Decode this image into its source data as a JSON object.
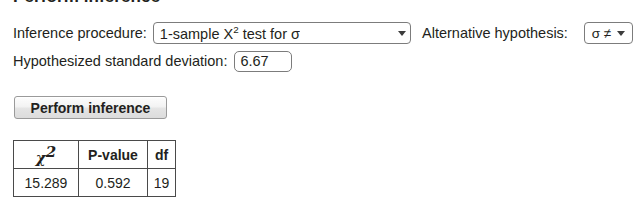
{
  "panel": {
    "title": "Perform inference"
  },
  "form": {
    "procedure_label": "Inference procedure:",
    "procedure_value_prefix": "1-sample X",
    "procedure_value_sup": "2",
    "procedure_value_suffix": " test for σ",
    "procedure_value_full": "1-sample X2 test for σ",
    "alt_hypothesis_label": "Alternative hypothesis:",
    "alt_hypothesis_value": "σ ≠",
    "sd_label": "Hypothesized standard deviation:",
    "sd_value": "6.67",
    "caret_icon": "chevron-down-icon"
  },
  "actions": {
    "perform_button": "Perform inference"
  },
  "results": {
    "headers": [
      "χ",
      "P-value",
      "df"
    ],
    "header_chi_symbol": "χ",
    "header_chi_sup": "2",
    "header_pvalue": "P-value",
    "header_df": "df",
    "rows": [
      {
        "chi_square": "15.289",
        "p_value": "0.592",
        "df": "19"
      }
    ]
  },
  "colors": {
    "background": "#ffffff",
    "text": "#231f20",
    "border": "#7c7c7c",
    "table_border": "#4a4a4a"
  }
}
